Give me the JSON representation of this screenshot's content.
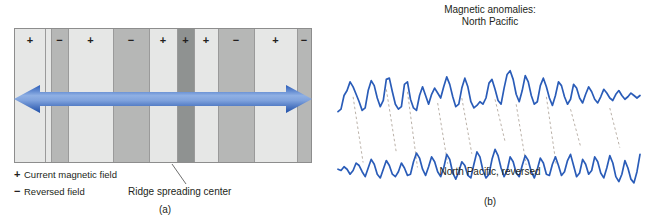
{
  "figure": {
    "panel_a": {
      "label": "(a)",
      "legend": [
        {
          "symbol": "+",
          "text": "Current magnetic field",
          "name": "legend-current-field"
        },
        {
          "symbol": "−",
          "text": "Reversed field",
          "name": "legend-reversed-field"
        }
      ],
      "ridge_caption": "Ridge spreading center",
      "arrow_color": "#2a5cb8",
      "arrow_highlight": "#7fa2dd",
      "stripe_box": {
        "x": 14,
        "y": 28,
        "width": 298,
        "height": 135
      },
      "colors": {
        "normal_light": "#e6e7e6",
        "reversed_mid": "#b6b7b6",
        "ridge_dark": "#8f9291",
        "border": "#8d8d8d",
        "separator": "#9a9a9a",
        "text": "#231f20"
      },
      "ridge_center_index": 10,
      "stripes": [
        {
          "start": 0,
          "width": 30,
          "polarity": "+",
          "shade": "normal_light"
        },
        {
          "start": 30,
          "width": 6,
          "polarity": "",
          "shade": "normal_light"
        },
        {
          "start": 36,
          "width": 17,
          "polarity": "−",
          "shade": "reversed_mid"
        },
        {
          "start": 53,
          "width": 45,
          "polarity": "+",
          "shade": "normal_light"
        },
        {
          "start": 98,
          "width": 36,
          "polarity": "−",
          "shade": "reversed_mid"
        },
        {
          "start": 134,
          "width": 28,
          "polarity": "+",
          "shade": "normal_light"
        },
        {
          "start": 162,
          "width": 17,
          "polarity": "+",
          "shade": "ridge_dark"
        },
        {
          "start": 179,
          "width": 24,
          "polarity": "+",
          "shade": "normal_light"
        },
        {
          "start": 203,
          "width": 36,
          "polarity": "−",
          "shade": "reversed_mid"
        },
        {
          "start": 239,
          "width": 43,
          "polarity": "+",
          "shade": "normal_light"
        },
        {
          "start": 282,
          "width": 14,
          "polarity": "−",
          "shade": "reversed_mid"
        },
        {
          "start": 296,
          "width": 26,
          "polarity": "+",
          "shade": "normal_light"
        }
      ]
    },
    "panel_b": {
      "label": "(b)",
      "title_line1": "Magnetic anomalies:",
      "title_line2": "North Pacific",
      "sublabel": "North Pacific, reversed",
      "trace_color": "#2a5cb8",
      "correlation_line_color": "#a89d92"
    }
  },
  "chart_data": {
    "type": "line",
    "title": "Magnetic anomalies: North Pacific",
    "xlabel": "",
    "ylabel": "Magnetic anomaly amplitude",
    "grid": false,
    "legend_position": "none",
    "axis_ranges": {
      "x": [
        0,
        100
      ],
      "y": [
        0,
        100
      ]
    },
    "series": [
      {
        "name": "North Pacific",
        "label": "Magnetic anomalies: North Pacific",
        "color": "#2a5cb8",
        "x": [
          0,
          1,
          2,
          3,
          4,
          5,
          6,
          7,
          8,
          9,
          10,
          11,
          12,
          13,
          14,
          15,
          16,
          17,
          18,
          19,
          20,
          21,
          22,
          23,
          24,
          25,
          26,
          27,
          28,
          29,
          30,
          31,
          32,
          33,
          34,
          35,
          36,
          37,
          38,
          39,
          40,
          41,
          42,
          43,
          44,
          45,
          46,
          47,
          48,
          49,
          50,
          51,
          52,
          53,
          54,
          55,
          56,
          57,
          58,
          59,
          60,
          61,
          62,
          63,
          64,
          65,
          66,
          67,
          68,
          69,
          70,
          71,
          72,
          73,
          74,
          75,
          76,
          77,
          78,
          79,
          80,
          81,
          82,
          83,
          84,
          85,
          86,
          87,
          88,
          89,
          90,
          91,
          92,
          93,
          94,
          95,
          96,
          97,
          98,
          99,
          100
        ],
        "values": [
          18,
          22,
          44,
          52,
          66,
          58,
          46,
          34,
          20,
          24,
          52,
          68,
          60,
          40,
          26,
          36,
          70,
          72,
          50,
          30,
          22,
          26,
          62,
          66,
          38,
          24,
          20,
          44,
          58,
          44,
          30,
          46,
          56,
          48,
          40,
          58,
          74,
          62,
          42,
          26,
          30,
          56,
          72,
          58,
          34,
          24,
          28,
          34,
          30,
          40,
          64,
          70,
          54,
          36,
          30,
          56,
          78,
          84,
          70,
          46,
          34,
          52,
          76,
          66,
          44,
          30,
          34,
          60,
          72,
          58,
          40,
          28,
          44,
          66,
          60,
          42,
          30,
          38,
          62,
          56,
          40,
          32,
          46,
          58,
          50,
          38,
          32,
          42,
          54,
          48,
          40,
          36,
          46,
          52,
          44,
          38,
          42,
          48,
          44,
          40,
          44
        ]
      },
      {
        "name": "North Pacific, reversed",
        "label": "North Pacific, reversed",
        "color": "#2a5cb8",
        "x": [
          0,
          1,
          2,
          3,
          4,
          5,
          6,
          7,
          8,
          9,
          10,
          11,
          12,
          13,
          14,
          15,
          16,
          17,
          18,
          19,
          20,
          21,
          22,
          23,
          24,
          25,
          26,
          27,
          28,
          29,
          30,
          31,
          32,
          33,
          34,
          35,
          36,
          37,
          38,
          39,
          40,
          41,
          42,
          43,
          44,
          45,
          46,
          47,
          48,
          49,
          50,
          51,
          52,
          53,
          54,
          55,
          56,
          57,
          58,
          59,
          60,
          61,
          62,
          63,
          64,
          65,
          66,
          67,
          68,
          69,
          70,
          71,
          72,
          73,
          74,
          75,
          76,
          77,
          78,
          79,
          80,
          81,
          82,
          83,
          84,
          85,
          86,
          87,
          88,
          89,
          90,
          91,
          92,
          93,
          94,
          95,
          96,
          97,
          98,
          99,
          100
        ],
        "values": [
          38,
          36,
          42,
          38,
          30,
          36,
          48,
          44,
          34,
          26,
          40,
          54,
          46,
          30,
          24,
          38,
          52,
          44,
          30,
          26,
          34,
          48,
          40,
          28,
          30,
          50,
          64,
          56,
          38,
          28,
          42,
          58,
          50,
          34,
          26,
          40,
          62,
          54,
          32,
          22,
          34,
          50,
          44,
          28,
          24,
          46,
          66,
          58,
          36,
          24,
          30,
          54,
          70,
          60,
          40,
          26,
          36,
          58,
          50,
          32,
          26,
          44,
          60,
          52,
          34,
          24,
          38,
          56,
          48,
          30,
          28,
          46,
          58,
          44,
          28,
          34,
          52,
          62,
          44,
          26,
          32,
          54,
          46,
          30,
          36,
          58,
          50,
          32,
          24,
          40,
          60,
          48,
          26,
          18,
          30,
          52,
          40,
          22,
          16,
          34,
          62
        ]
      }
    ],
    "annotations": [
      {
        "type": "correlation-line",
        "from_series": 0,
        "to_series": 1,
        "x": 5
      },
      {
        "type": "correlation-line",
        "from_series": 0,
        "to_series": 1,
        "x": 16
      },
      {
        "type": "correlation-line",
        "from_series": 0,
        "to_series": 1,
        "x": 23
      },
      {
        "type": "correlation-line",
        "from_series": 0,
        "to_series": 1,
        "x": 33
      },
      {
        "type": "correlation-line",
        "from_series": 0,
        "to_series": 1,
        "x": 41
      },
      {
        "type": "correlation-line",
        "from_series": 0,
        "to_series": 1,
        "x": 52
      },
      {
        "type": "correlation-line",
        "from_series": 0,
        "to_series": 1,
        "x": 59
      },
      {
        "type": "correlation-line",
        "from_series": 0,
        "to_series": 1,
        "x": 69
      },
      {
        "type": "correlation-line",
        "from_series": 0,
        "to_series": 1,
        "x": 77
      },
      {
        "type": "correlation-line",
        "from_series": 0,
        "to_series": 1,
        "x": 90
      }
    ]
  }
}
